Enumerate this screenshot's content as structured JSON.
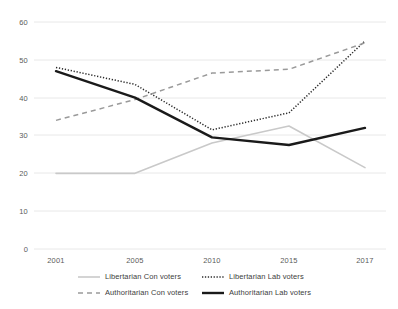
{
  "chart_data": {
    "type": "line",
    "title": "",
    "xlabel": "",
    "ylabel": "",
    "categories": [
      "2001",
      "2005",
      "2010",
      "2015",
      "2017"
    ],
    "x": [
      2001,
      2005,
      2010,
      2015,
      2017
    ],
    "ylim": [
      0,
      60
    ],
    "yticks": [
      0,
      10,
      20,
      30,
      40,
      50,
      60
    ],
    "grid": true,
    "grid_axis": "y",
    "legend_position": "bottom",
    "series": [
      {
        "name": "Libertarian Con voters",
        "values": [
          20,
          20,
          28,
          32.5,
          21.5
        ],
        "color": "#c9c9c9",
        "style": "solid",
        "width": 1.6
      },
      {
        "name": "Libertarian Lab voters",
        "values": [
          48,
          43.5,
          31.5,
          36,
          55
        ],
        "color": "#2b2b2b",
        "style": "dotted",
        "width": 1.5
      },
      {
        "name": "Authoritarian Con voters",
        "values": [
          34,
          39.5,
          46.5,
          47.5,
          54.5
        ],
        "color": "#9a9a9a",
        "style": "dashed",
        "width": 1.5
      },
      {
        "name": "Authoritarian Lab voters",
        "values": [
          47,
          40,
          29.5,
          27.5,
          32
        ],
        "color": "#1a1a1a",
        "style": "solid",
        "width": 2.4
      }
    ]
  },
  "axes": {
    "y_tick_labels": [
      "60",
      "50",
      "40",
      "30",
      "20",
      "10",
      "0"
    ],
    "x_tick_labels": [
      "2001",
      "2005",
      "2010",
      "2015",
      "2017"
    ]
  },
  "legend": {
    "items": [
      {
        "label": "Libertarian Con voters"
      },
      {
        "label": "Libertarian Lab voters"
      },
      {
        "label": "Authoritarian Con voters"
      },
      {
        "label": "Authoritarian Lab voters"
      }
    ]
  },
  "colors": {
    "grid": "#e8e8e8",
    "axis_text": "#5b5b5b",
    "background": "#ffffff"
  }
}
